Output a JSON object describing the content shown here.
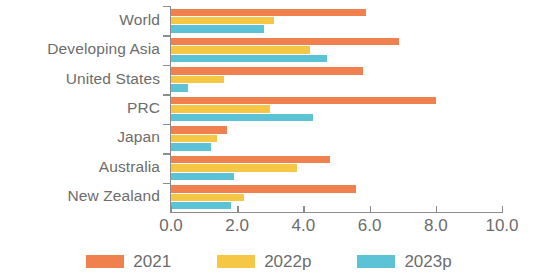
{
  "chart_data": {
    "type": "bar",
    "orientation": "horizontal",
    "title": "",
    "subtitle": "",
    "xlabel": "",
    "ylabel": "",
    "xlim": [
      0.0,
      10.0
    ],
    "xticks": [
      "0.0",
      "2.0",
      "4.0",
      "6.0",
      "8.0",
      "10.0"
    ],
    "xtick_values": [
      0.0,
      2.0,
      4.0,
      6.0,
      8.0,
      10.0
    ],
    "grid": false,
    "legend_position": "bottom",
    "categories": [
      "World",
      "Developing Asia",
      "United States",
      "PRC",
      "Japan",
      "Australia",
      "New Zealand"
    ],
    "series": [
      {
        "name": "2021",
        "color": "#F0804E",
        "values": [
          5.9,
          6.9,
          5.8,
          8.0,
          1.7,
          4.8,
          5.6
        ]
      },
      {
        "name": "2022p",
        "color": "#F6C744",
        "values": [
          3.1,
          4.2,
          1.6,
          3.0,
          1.4,
          3.8,
          2.2
        ]
      },
      {
        "name": "2023p",
        "color": "#5CC3D6",
        "values": [
          2.8,
          4.7,
          0.5,
          4.3,
          1.2,
          1.9,
          1.8
        ]
      }
    ]
  },
  "axis": {
    "tick_color": "#8c8c8c",
    "label_color": "#6d6d6d"
  },
  "legend": {
    "items": [
      {
        "label": "2021",
        "color": "#F0804E"
      },
      {
        "label": "2022p",
        "color": "#F6C744"
      },
      {
        "label": "2023p",
        "color": "#5CC3D6"
      }
    ]
  }
}
